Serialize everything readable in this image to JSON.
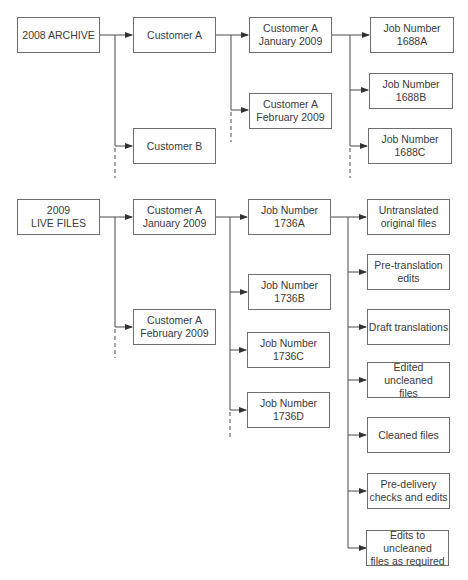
{
  "diagram": {
    "type": "folder hierarchy flowchart",
    "sections": [
      {
        "name": "archive",
        "root": "2008 ARCHIVE",
        "customers": [
          "Customer A",
          "Customer B"
        ],
        "periods": [
          "Customer A\nJanuary 2009",
          "Customer A\nFebruary 2009"
        ],
        "jobs": [
          "Job Number\n1688A",
          "Job Number\n1688B",
          "Job Number\n1688C"
        ]
      },
      {
        "name": "live",
        "root": "2009\nLIVE FILES",
        "periods": [
          "Customer A\nJanuary 2009",
          "Customer A\nFebruary 2009"
        ],
        "jobs": [
          "Job Number\n1736A",
          "Job Number\n1736B",
          "Job Number\n1736C",
          "Job Number\n1736D"
        ],
        "stages": [
          "Untranslated\noriginal files",
          "Pre-translation\nedits",
          "Draft translations",
          "Edited uncleaned\nfiles",
          "Cleaned files",
          "Pre-delivery\nchecks and edits",
          "Edits to uncleaned\nfiles as required"
        ]
      }
    ],
    "colors": {
      "line": "#4a4a4a",
      "box_border": "#6e6e6e",
      "text": "#3a3a3a"
    }
  }
}
